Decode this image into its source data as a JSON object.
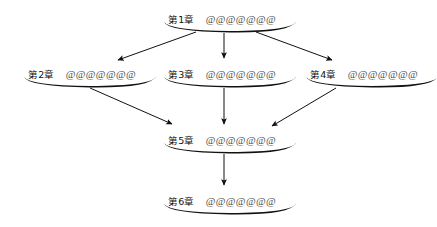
{
  "diagram": {
    "type": "flowchart",
    "title": "",
    "background_color": "#ffffff",
    "stroke_color": "#111111",
    "text_color": "#111111",
    "at_text_color": "#4a4a4a",
    "nodes": [
      {
        "id": "ch1",
        "chapter": "第1章",
        "at_text": "@@@@@@@",
        "x": 168,
        "y": 10,
        "underline_x": 164,
        "underline_y": 21,
        "underline_w": 132
      },
      {
        "id": "ch2",
        "chapter": "第2章",
        "at_text": "@@@@@@@",
        "x": 28,
        "y": 65,
        "underline_x": 24,
        "underline_y": 76,
        "underline_w": 132
      },
      {
        "id": "ch3",
        "chapter": "第3章",
        "at_text": "@@@@@@@",
        "x": 168,
        "y": 65,
        "underline_x": 164,
        "underline_y": 76,
        "underline_w": 132
      },
      {
        "id": "ch4",
        "chapter": "第4章",
        "at_text": "@@@@@@@",
        "x": 310,
        "y": 65,
        "underline_x": 306,
        "underline_y": 76,
        "underline_w": 132
      },
      {
        "id": "ch5",
        "chapter": "第5章",
        "at_text": "@@@@@@@",
        "x": 168,
        "y": 131,
        "underline_x": 164,
        "underline_y": 142,
        "underline_w": 132
      },
      {
        "id": "ch6",
        "chapter": "第6章",
        "at_text": "@@@@@@@",
        "x": 168,
        "y": 192,
        "underline_x": 164,
        "underline_y": 203,
        "underline_w": 132
      }
    ],
    "edges": [
      {
        "id": "e1",
        "from": "ch1",
        "to": "ch2",
        "direction": "down-left"
      },
      {
        "id": "e2",
        "from": "ch1",
        "to": "ch3",
        "direction": "down"
      },
      {
        "id": "e3",
        "from": "ch1",
        "to": "ch4",
        "direction": "down-right"
      },
      {
        "id": "e4",
        "from": "ch2",
        "to": "ch5",
        "direction": "down-right"
      },
      {
        "id": "e5",
        "from": "ch3",
        "to": "ch5",
        "direction": "down"
      },
      {
        "id": "e6",
        "from": "ch4",
        "to": "ch5",
        "direction": "down-left"
      },
      {
        "id": "e7",
        "from": "ch5",
        "to": "ch6",
        "direction": "down"
      }
    ]
  }
}
